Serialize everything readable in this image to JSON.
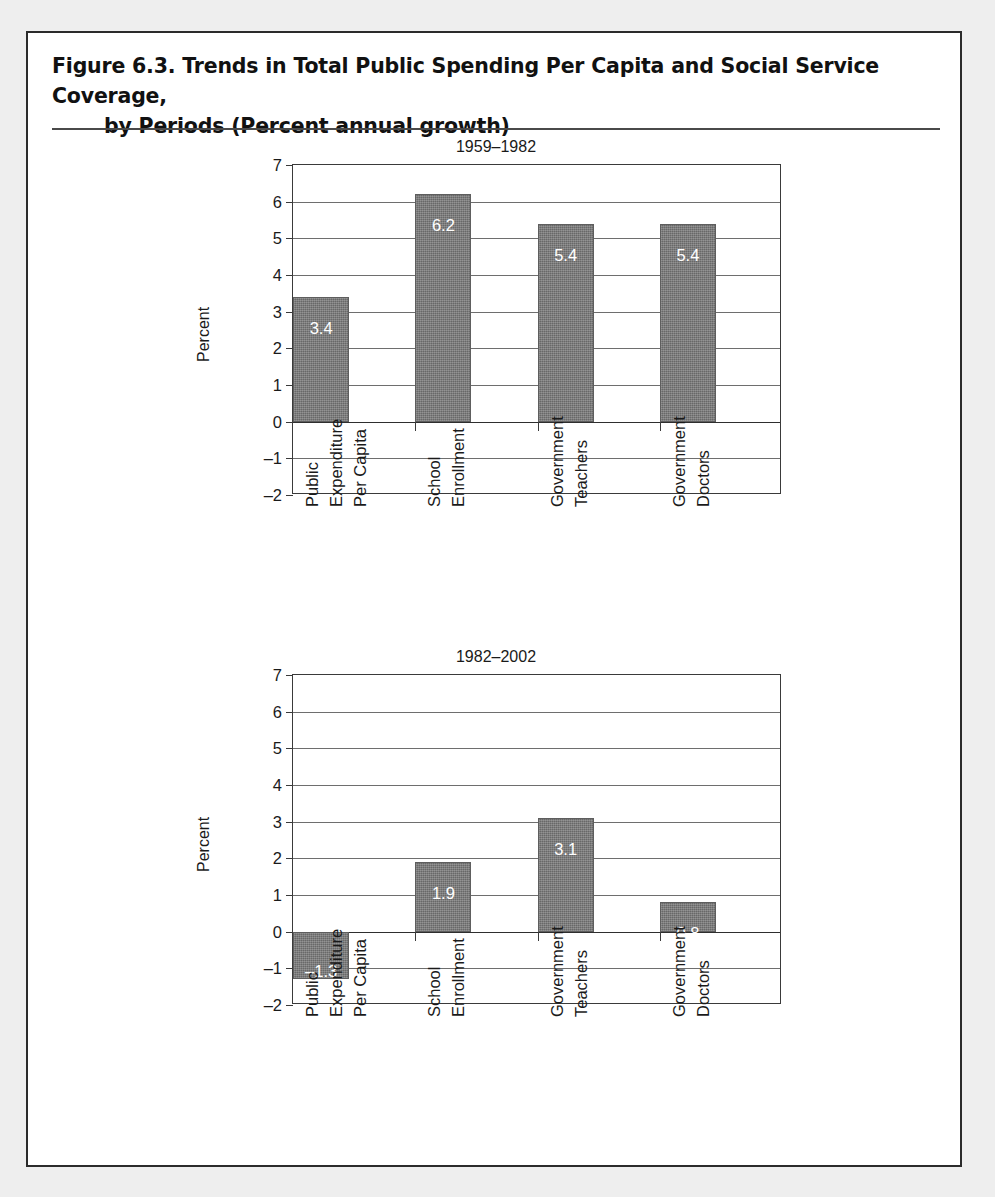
{
  "figure": {
    "title_line1": "Figure 6.3.  Trends in Total Public Spending Per Capita and Social Service Coverage,",
    "title_line2": "by Periods (Percent annual growth)"
  },
  "chart_data": [
    {
      "type": "bar",
      "title": "1959–1982",
      "xlabel": "",
      "ylabel": "Percent",
      "ylim": [
        -2,
        7
      ],
      "yticks": [
        "7",
        "6",
        "5",
        "4",
        "3",
        "2",
        "1",
        "0",
        "–1",
        "–2"
      ],
      "grid": true,
      "legend": "none",
      "categories": [
        [
          "Public",
          "Expenditure",
          "Per Capita"
        ],
        [
          "School",
          "Enrollment"
        ],
        [
          "Government",
          "Teachers"
        ],
        [
          "Government",
          "Doctors"
        ]
      ],
      "values": [
        3.4,
        6.2,
        5.4,
        5.4
      ],
      "labels": [
        "3.4",
        "6.2",
        "5.4",
        "5.4"
      ]
    },
    {
      "type": "bar",
      "title": "1982–2002",
      "xlabel": "",
      "ylabel": "Percent",
      "ylim": [
        -2,
        7
      ],
      "yticks": [
        "7",
        "6",
        "5",
        "4",
        "3",
        "2",
        "1",
        "0",
        "–1",
        "–2"
      ],
      "grid": true,
      "legend": "none",
      "categories": [
        [
          "Public",
          "Expenditure",
          "Per Capita"
        ],
        [
          "School",
          "Enrollment"
        ],
        [
          "Government",
          "Teachers"
        ],
        [
          "Government",
          "Doctors"
        ]
      ],
      "values": [
        -1.3,
        1.9,
        3.1,
        0.8
      ],
      "labels": [
        "–1.3",
        "1.9",
        "3.1",
        "0.8"
      ]
    }
  ],
  "colors": {
    "bar_fill": "#757575",
    "bar_label": "#ffffff",
    "axis": "#3a3a3a",
    "grid": "#6e6e6e",
    "page_border": "#2b2b2b",
    "background": "#ffffff"
  }
}
